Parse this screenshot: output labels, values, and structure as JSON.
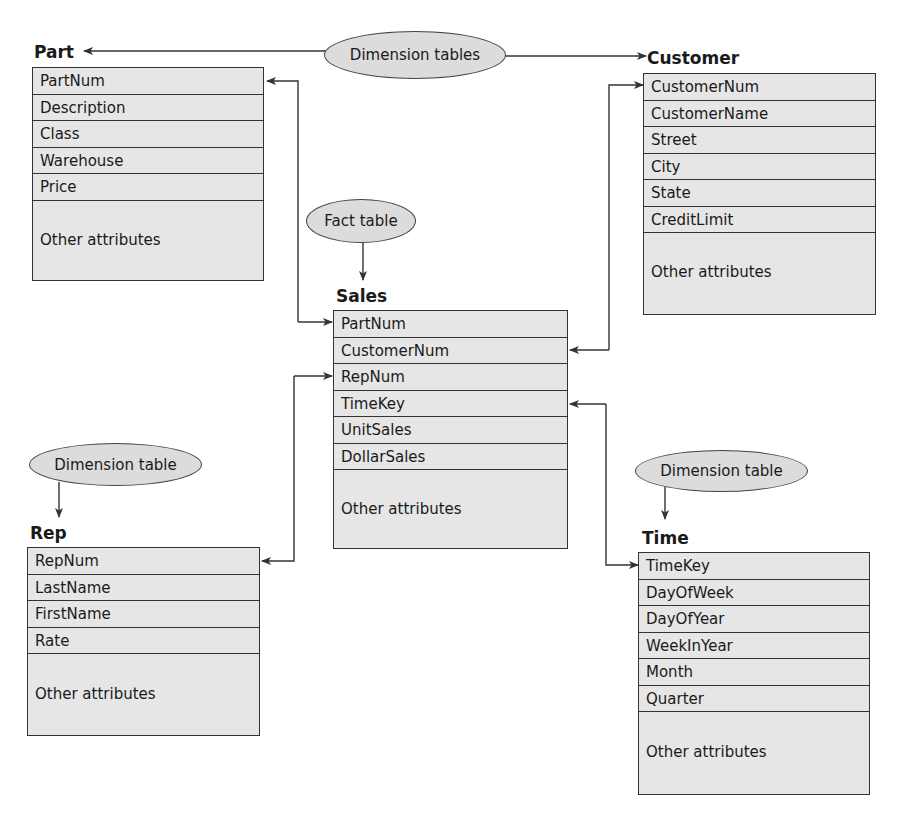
{
  "bubbles": {
    "dimension_tables": "Dimension tables",
    "fact_table": "Fact table",
    "rep_dimension": "Dimension table",
    "time_dimension": "Dimension table"
  },
  "tables": {
    "part": {
      "title": "Part",
      "attributes": [
        "PartNum",
        "Description",
        "Class",
        "Warehouse",
        "Price"
      ],
      "other": "Other attributes"
    },
    "customer": {
      "title": "Customer",
      "attributes": [
        "CustomerNum",
        "CustomerName",
        "Street",
        "City",
        "State",
        "CreditLimit"
      ],
      "other": "Other attributes"
    },
    "sales": {
      "title": "Sales",
      "attributes": [
        "PartNum",
        "CustomerNum",
        "RepNum",
        "TimeKey",
        "UnitSales",
        "DollarSales"
      ],
      "other": "Other attributes"
    },
    "rep": {
      "title": "Rep",
      "attributes": [
        "RepNum",
        "LastName",
        "FirstName",
        "Rate"
      ],
      "other": "Other attributes"
    },
    "time": {
      "title": "Time",
      "attributes": [
        "TimeKey",
        "DayOfWeek",
        "DayOfYear",
        "WeekInYear",
        "Month",
        "Quarter"
      ],
      "other": "Other attributes"
    }
  },
  "relationships": [
    {
      "from": "Sales.PartNum",
      "to": "Part.PartNum"
    },
    {
      "from": "Sales.CustomerNum",
      "to": "Customer.CustomerNum"
    },
    {
      "from": "Sales.RepNum",
      "to": "Rep.RepNum"
    },
    {
      "from": "Sales.TimeKey",
      "to": "Time.TimeKey"
    }
  ],
  "colors": {
    "box_fill": "#e6e6e6",
    "bubble_fill": "#dcdcdc",
    "line": "#333333"
  }
}
